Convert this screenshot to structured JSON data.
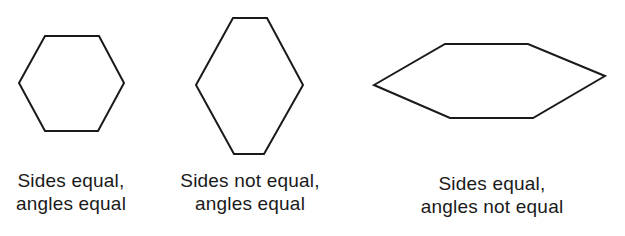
{
  "figures": [
    {
      "name": "regular-hexagon",
      "points": "45,36 99,36 124,83 98,131 45,131 19,83",
      "caption": {
        "line1": "Sides equal,",
        "line2": "angles equal"
      }
    },
    {
      "name": "equiangular-hexagon",
      "points": "233,18 267,18 303,85 264,154 234,154 196,85",
      "caption": {
        "line1": "Sides not equal,",
        "line2": "angles equal"
      }
    },
    {
      "name": "equilateral-hexagon",
      "points": "374,85 445,44 528,44 605,76 533,118 450,118",
      "caption": {
        "line1": "Sides equal,",
        "line2": "angles not equal"
      }
    }
  ],
  "style": {
    "stroke": "#1a1a1a",
    "stroke_width": 2
  }
}
